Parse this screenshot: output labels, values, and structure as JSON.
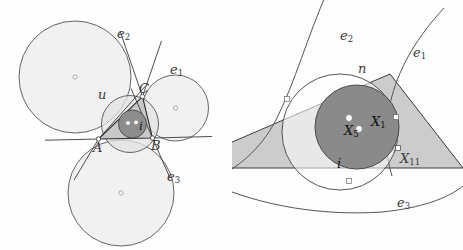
{
  "figure": {
    "width": 463,
    "height": 250,
    "background": "#fefefe",
    "caption": "Two-panel Euclidean geometry diagram: triangle with circumcircle, incircle, three excircles (left) and a magnified view showing the nine-point circle tangent to the incircle at the Feuerbach point (right)"
  },
  "colors": {
    "page_background": "#fefefe",
    "stroke": "#55555a",
    "stroke_dark": "#2b2b2f",
    "excircle_fill": "#eeeeee",
    "circumcircle_fill": "#e4e4e4",
    "triangle_fill": "#c9c9c9",
    "incircle_fill": "#8d8d8d",
    "incircle_fill_right": "#8a8a8a",
    "ninepoint_region": "#ffffff",
    "vertex_dot": "#ffffff",
    "label_text": "#3a3a3a"
  },
  "left_panel": {
    "name": "triangle-with-excircles-overview",
    "labels": {
      "excircle_1": "e",
      "excircle_1_sub": "1",
      "excircle_2": "e",
      "excircle_2_sub": "2",
      "excircle_3": "e",
      "excircle_3_sub": "3",
      "circumcircle": "u",
      "incircle": "i",
      "vertex_a": "A",
      "vertex_b": "B",
      "vertex_c": "C"
    },
    "geometry": {
      "vertices": {
        "A": [
          98.5,
          139.0
        ],
        "B": [
          152.5,
          138.0
        ],
        "C": [
          142.5,
          96.5
        ]
      },
      "circumcircle": {
        "cx": 130.0,
        "cy": 124.0,
        "r": 28.5
      },
      "incircle": {
        "cx": 132.5,
        "cy": 124.0,
        "r": 14.0
      },
      "excircle_2": {
        "cx": 75.0,
        "cy": 77.0,
        "r": 56.0
      },
      "excircle_1": {
        "cx": 175.5,
        "cy": 108.0,
        "r": 33.0
      },
      "excircle_3": {
        "cx": 121.0,
        "cy": 193.0,
        "r": 53.0
      },
      "center_markers": [
        [
          75.0,
          77.0
        ],
        [
          175.5,
          108.0
        ],
        [
          121.0,
          193.0
        ]
      ],
      "incircle_dots": [
        [
          128.0,
          123.0
        ],
        [
          136.0,
          122.5
        ]
      ]
    }
  },
  "right_panel": {
    "name": "feuerbach-point-detail",
    "labels": {
      "excircle_1": "e",
      "excircle_1_sub": "1",
      "excircle_2": "e",
      "excircle_2_sub": "2",
      "excircle_3": "e",
      "excircle_3_sub": "3",
      "ninepoint_circle": "n",
      "incircle": "i",
      "incenter": "X",
      "incenter_sub": "1",
      "ninepoint_center": "X",
      "ninepoint_center_sub": "5",
      "feuerbach_point": "X",
      "feuerbach_point_sub": "11"
    },
    "geometry": {
      "incircle": {
        "cx": 357.0,
        "cy": 127.0,
        "r": 42.0
      },
      "ninepoint_circle": {
        "cx": 340.0,
        "cy": 132.0,
        "r": 58.0
      },
      "incenter": [
        357.0,
        127.0
      ],
      "ninepoint_center": [
        348.5,
        120.0
      ],
      "feuerbach_point": [
        398.5,
        150.0
      ],
      "triangle_apex": [
        390.0,
        74.0
      ],
      "triangle_base_y": 178.0,
      "touch_points": [
        [
          287.0,
          100.0
        ],
        [
          396.0,
          118.0
        ],
        [
          349.0,
          182.0
        ]
      ]
    }
  }
}
